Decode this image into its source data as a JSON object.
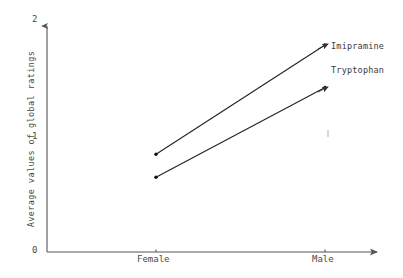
{
  "chart_data": {
    "type": "line",
    "title": "",
    "subtitle": "",
    "xlabel": "",
    "ylabel": "Average values of global ratings",
    "categories": [
      "Female",
      "Male"
    ],
    "x_tick_labels": [
      "Female",
      "Male"
    ],
    "y_tick_labels": [
      "0",
      "1",
      "2"
    ],
    "y_ticks": [
      0,
      1,
      2
    ],
    "ylim": [
      0,
      2
    ],
    "grid": false,
    "legend_position": "inline-right-of-line-ends",
    "annotations": [
      "Imipramine",
      "Tryptophan"
    ],
    "series": [
      {
        "name": "Imipramine",
        "color": "#222222",
        "values": [
          0.85,
          1.8
        ],
        "points": [
          {
            "category": "Female",
            "value": 0.85
          },
          {
            "category": "Male",
            "value": 1.8
          }
        ]
      },
      {
        "name": "Tryptophan",
        "color": "#222222",
        "values": [
          0.65,
          1.43
        ],
        "points": [
          {
            "category": "Female",
            "value": 0.65
          },
          {
            "category": "Male",
            "value": 1.43
          }
        ]
      }
    ]
  },
  "axes": {
    "y_tick_top": "2",
    "y_tick_mid": "1",
    "y_tick_bottom": "0",
    "y_axis_title": "Average values of global ratings",
    "x_tick_left": "Female",
    "x_tick_right": "Male"
  },
  "series_labels": {
    "imipramine": "Imipramine",
    "tryptophan": "Tryptophan"
  },
  "colors": {
    "line": "#222222",
    "axis": "#555555",
    "text": "#3a3a3a",
    "background": "#ffffff"
  }
}
